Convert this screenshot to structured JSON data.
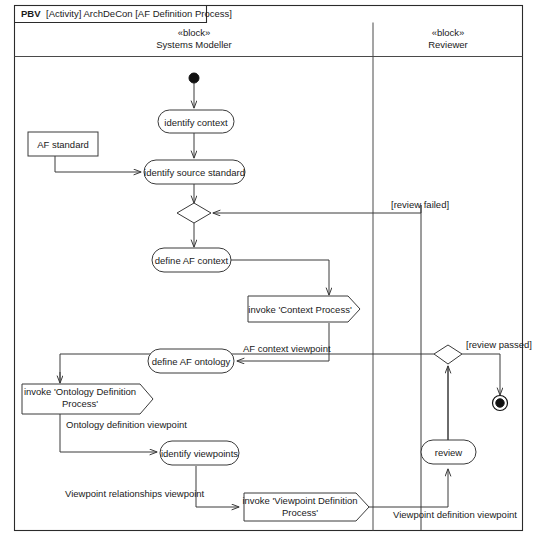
{
  "diagram": {
    "frame_tag_prefix": "PBV",
    "frame_tag_rest": " [Activity] ArchDeCon [AF Definition Process]",
    "stereotype": "«block»",
    "lanes": [
      {
        "stereotype": "«block»",
        "name": "Systems Modeller"
      },
      {
        "stereotype": "«block»",
        "name": "Reviewer"
      }
    ],
    "nodes": {
      "initial": "initial-node",
      "identify_context": "identify context",
      "af_standard": "AF standard",
      "identify_source_standard": "identify source standard",
      "merge_one": "merge-node",
      "define_af_context": "define AF context",
      "invoke_context_process": "invoke 'Context Process'",
      "define_af_ontology": "define AF ontology",
      "invoke_ontology_definition_process_line1": "invoke 'Ontology Definition",
      "invoke_ontology_definition_process_line2": "Process'",
      "identify_viewpoints": "identify viewpoints",
      "invoke_viewpoint_definition_process_line1": "invoke 'Viewpoint Definition",
      "invoke_viewpoint_definition_process_line2": "Process'",
      "review": "review",
      "review_decision": "decision-node",
      "final": "final-node"
    },
    "edge_labels": {
      "review_failed": "[review failed]",
      "review_passed": "[review passed]",
      "af_context_viewpoint": "AF context viewpoint",
      "ontology_definition_viewpoint": "Ontology definition viewpoint",
      "viewpoint_relationships_viewpoint": "Viewpoint relationships viewpoint",
      "viewpoint_definition_viewpoint": "Viewpoint definition viewpoint"
    },
    "colors": {
      "stroke": "#3a3a3a",
      "frame": "#2b2b2b",
      "text": "#1a1a1a",
      "background": "#ffffff"
    }
  }
}
